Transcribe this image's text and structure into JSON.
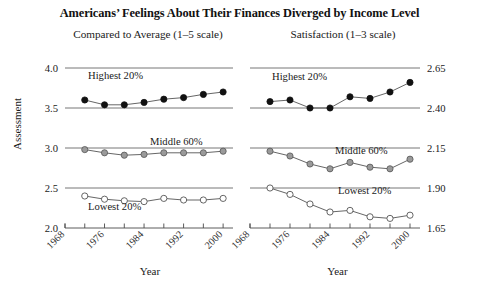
{
  "chart_data": {
    "type": "line",
    "title": "Americans’ Feelings About Their Finances Diverged by Income Level",
    "xlabel": "Year",
    "ylabel": "Assessment",
    "grid": true,
    "legend_position": "inline-labels",
    "panels": [
      {
        "subtitle": "Compared to Average (1–5 scale)",
        "xlabel": "Year",
        "ylabel": "Assessment",
        "ylim": [
          2.0,
          4.0
        ],
        "yticks": [
          "2.0",
          "2.5",
          "3.0",
          "3.5",
          "4.0"
        ],
        "ytick_values": [
          2.0,
          2.5,
          3.0,
          3.5,
          4.0
        ],
        "ytick_side": "left",
        "xlim": [
          1968,
          2002
        ],
        "xticks": [
          "1968",
          "1976",
          "1984",
          "1992",
          "2000"
        ],
        "xtick_values": [
          1968,
          1976,
          1984,
          1992,
          2000
        ],
        "x": [
          1972,
          1976,
          1980,
          1984,
          1988,
          1992,
          1996,
          2000
        ],
        "series": [
          {
            "name": "Highest 20%",
            "marker": "filled-black-circle",
            "color": "#111111",
            "values": [
              3.6,
              3.54,
              3.54,
              3.57,
              3.61,
              3.63,
              3.67,
              3.7
            ]
          },
          {
            "name": "Middle 60%",
            "marker": "filled-gray-circle",
            "color": "#9a9a9a",
            "values": [
              2.98,
              2.94,
              2.91,
              2.92,
              2.94,
              2.94,
              2.94,
              2.96
            ]
          },
          {
            "name": "Lowest 20%",
            "marker": "open-circle",
            "color": "#ffffff",
            "values": [
              2.4,
              2.36,
              2.34,
              2.33,
              2.37,
              2.35,
              2.35,
              2.37
            ]
          }
        ]
      },
      {
        "subtitle": "Satisfaction (1–3 scale)",
        "xlabel": "Year",
        "ylabel": "",
        "ylim": [
          1.65,
          2.65
        ],
        "yticks": [
          "1.65",
          "1.90",
          "2.15",
          "2.40",
          "2.65"
        ],
        "ytick_values": [
          1.65,
          1.9,
          2.15,
          2.4,
          2.65
        ],
        "ytick_side": "right",
        "xlim": [
          1968,
          2002
        ],
        "xticks": [
          "1968",
          "1976",
          "1984",
          "1992",
          "2000"
        ],
        "xtick_values": [
          1968,
          1976,
          1984,
          1992,
          2000
        ],
        "x": [
          1972,
          1976,
          1980,
          1984,
          1988,
          1992,
          1996,
          2000
        ],
        "series": [
          {
            "name": "Highest 20%",
            "marker": "filled-black-circle",
            "color": "#111111",
            "values": [
              2.44,
              2.45,
              2.4,
              2.4,
              2.47,
              2.46,
              2.5,
              2.56
            ]
          },
          {
            "name": "Middle 60%",
            "marker": "filled-gray-circle",
            "color": "#9a9a9a",
            "values": [
              2.13,
              2.1,
              2.05,
              2.02,
              2.06,
              2.03,
              2.02,
              2.08
            ]
          },
          {
            "name": "Lowest 20%",
            "marker": "open-circle",
            "color": "#ffffff",
            "values": [
              1.9,
              1.86,
              1.8,
              1.75,
              1.76,
              1.72,
              1.71,
              1.73
            ]
          }
        ]
      }
    ]
  },
  "labels": {
    "highest": "Highest 20%",
    "middle": "Middle 60%",
    "lowest": "Lowest 20%"
  }
}
